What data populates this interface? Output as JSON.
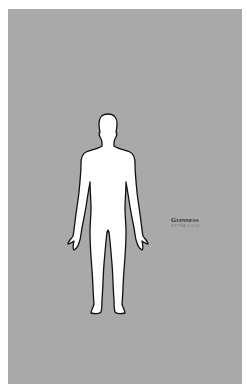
{
  "poster": {
    "background_color": "#a9a9a9",
    "illustration": "human-body-outline-front",
    "brand": {
      "name": "Guinness",
      "subtitle": "EXTRA COLD"
    }
  }
}
